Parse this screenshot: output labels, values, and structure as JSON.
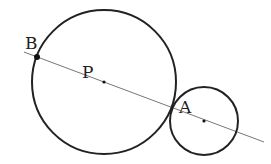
{
  "diagram": {
    "type": "geometry",
    "colors": {
      "circle_stroke": "#222222",
      "line_stroke": "#777777",
      "point_fill": "#111111",
      "label": "#222222"
    },
    "line": {
      "x1": 24,
      "y1": 52,
      "x2": 264,
      "y2": 142
    },
    "circles": [
      {
        "id": "large",
        "center": "P",
        "cx": 104,
        "cy": 82,
        "r": 72
      },
      {
        "id": "small",
        "center": "A",
        "cx": 204,
        "cy": 121,
        "r": 34
      }
    ],
    "points": [
      {
        "name": "B",
        "x": 37,
        "y": 57,
        "r": 3
      },
      {
        "name": "P",
        "x": 104,
        "y": 82,
        "r": 1.6
      },
      {
        "name": "A",
        "x": 204,
        "y": 121,
        "r": 1.6
      }
    ],
    "labels": {
      "B": {
        "text": "B",
        "x": 25,
        "y": 49
      },
      "P": {
        "text": "P",
        "x": 82,
        "y": 78
      },
      "A": {
        "text": "A",
        "x": 179,
        "y": 113
      }
    }
  }
}
